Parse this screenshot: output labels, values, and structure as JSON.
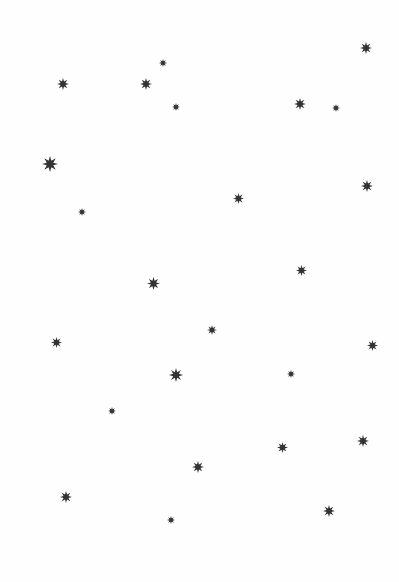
{
  "canvas": {
    "width": 399,
    "height": 582,
    "background": "#fefefe"
  },
  "star_color": "#333333",
  "stars": [
    {
      "x": 366,
      "y": 48,
      "size": 12
    },
    {
      "x": 63,
      "y": 84,
      "size": 12
    },
    {
      "x": 163,
      "y": 63,
      "size": 8
    },
    {
      "x": 146,
      "y": 84,
      "size": 12
    },
    {
      "x": 176,
      "y": 107,
      "size": 8
    },
    {
      "x": 300,
      "y": 104,
      "size": 12
    },
    {
      "x": 336,
      "y": 108,
      "size": 8
    },
    {
      "x": 50,
      "y": 164,
      "size": 16
    },
    {
      "x": 367,
      "y": 186,
      "size": 12
    },
    {
      "x": 238,
      "y": 198,
      "size": 11
    },
    {
      "x": 82,
      "y": 212,
      "size": 8
    },
    {
      "x": 301,
      "y": 270,
      "size": 11
    },
    {
      "x": 153,
      "y": 283,
      "size": 13
    },
    {
      "x": 212,
      "y": 330,
      "size": 10
    },
    {
      "x": 56,
      "y": 342,
      "size": 11
    },
    {
      "x": 372,
      "y": 345,
      "size": 11
    },
    {
      "x": 176,
      "y": 375,
      "size": 14
    },
    {
      "x": 291,
      "y": 374,
      "size": 8
    },
    {
      "x": 112,
      "y": 411,
      "size": 8
    },
    {
      "x": 282,
      "y": 447,
      "size": 11
    },
    {
      "x": 363,
      "y": 441,
      "size": 12
    },
    {
      "x": 198,
      "y": 467,
      "size": 12
    },
    {
      "x": 66,
      "y": 497,
      "size": 12
    },
    {
      "x": 171,
      "y": 520,
      "size": 8
    },
    {
      "x": 329,
      "y": 511,
      "size": 12
    }
  ]
}
